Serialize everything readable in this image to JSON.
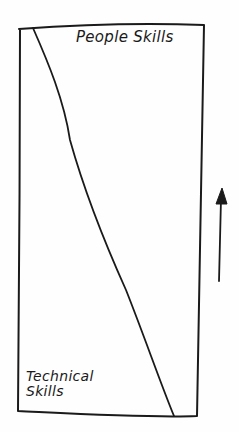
{
  "diagram": {
    "type": "hand-drawn skill balance diagram",
    "region_top_label": "People Skills",
    "region_bottom_label": {
      "line1": "Technical",
      "line2": "Skills"
    },
    "arrow": {
      "direction": "up",
      "meaning": "career progression increases people skills share"
    },
    "colors": {
      "ink": "#1a1a1a",
      "paper": "#fefefe"
    }
  }
}
